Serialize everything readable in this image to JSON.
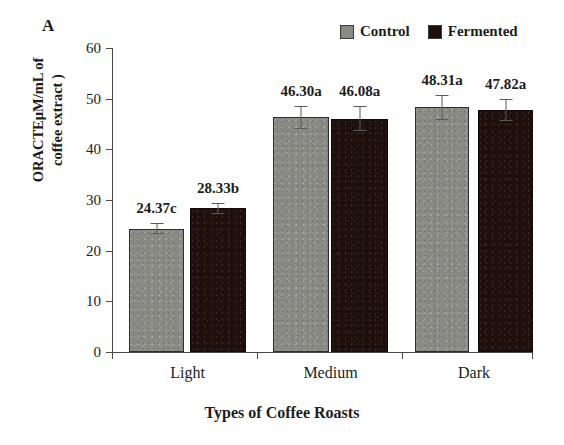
{
  "panel": {
    "label": "A"
  },
  "legend": {
    "position": "top-right",
    "items": [
      {
        "name": "Control",
        "color": "#8a8a85"
      },
      {
        "name": "Fermented",
        "color": "#1d100c"
      }
    ]
  },
  "axis": {
    "y_title_line1": "ORACTEμM/mL of",
    "y_title_line2": "coffee extract )",
    "x_title": "Types of Coffee Roasts",
    "y_ticks": [
      "0",
      "10",
      "20",
      "30",
      "40",
      "50",
      "60"
    ]
  },
  "chart_data": {
    "type": "bar",
    "title": "A",
    "xlabel": "Types of Coffee Roasts",
    "ylabel": "ORACTEμM/mL of coffee extract )",
    "ylim": [
      0,
      60
    ],
    "ytick_step": 10,
    "grid": false,
    "legend_position": "top-right",
    "categories": [
      "Light",
      "Medium",
      "Dark"
    ],
    "series": [
      {
        "name": "Control",
        "color": "#8a8a85",
        "values": [
          24.37,
          46.3,
          48.31
        ],
        "errors": [
          1.1,
          2.3,
          2.5
        ],
        "labels": [
          "24.37c",
          "46.30a",
          "48.31a"
        ]
      },
      {
        "name": "Fermented",
        "color": "#1d100c",
        "values": [
          28.33,
          46.08,
          47.82
        ],
        "errors": [
          1.0,
          2.4,
          2.2
        ],
        "labels": [
          "28.33b",
          "46.08a",
          "47.82a"
        ]
      }
    ],
    "bars": [
      {
        "group": "Light",
        "series": "Control",
        "value": 24.37,
        "error": 1.1,
        "label": "24.37c"
      },
      {
        "group": "Light",
        "series": "Fermented",
        "value": 28.33,
        "error": 1.0,
        "label": "28.33b"
      },
      {
        "group": "Medium",
        "series": "Control",
        "value": 46.3,
        "error": 2.3,
        "label": "46.30a"
      },
      {
        "group": "Medium",
        "series": "Fermented",
        "value": 46.08,
        "error": 2.4,
        "label": "46.08a"
      },
      {
        "group": "Dark",
        "series": "Control",
        "value": 48.31,
        "error": 2.5,
        "label": "48.31a"
      },
      {
        "group": "Dark",
        "series": "Fermented",
        "value": 47.82,
        "error": 2.2,
        "label": "47.82a"
      }
    ]
  }
}
